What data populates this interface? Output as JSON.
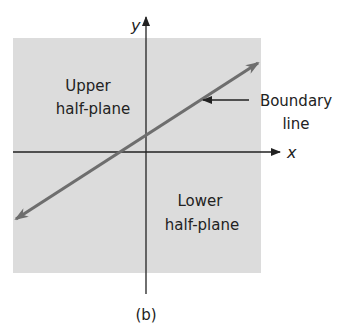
{
  "figure": {
    "caption": "(b)",
    "axes": {
      "x_label": "x",
      "y_label": "y"
    },
    "regions": {
      "upper": {
        "line1": "Upper",
        "line2": "half-plane"
      },
      "lower": {
        "line1": "Lower",
        "line2": "half-plane"
      }
    },
    "boundary_label": {
      "line1": "Boundary",
      "line2": "line"
    },
    "colors": {
      "plane_fill": "#dcdcdc",
      "boundary_line": "#6e6e6e",
      "axes": "#222222",
      "text": "#222222"
    }
  }
}
